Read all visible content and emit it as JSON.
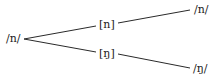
{
  "diagram": {
    "type": "tree",
    "colors": {
      "line": "#2a2a2a",
      "text": "#1a1a1a",
      "background": "#ffffff"
    },
    "nodes": {
      "root": {
        "label": "/n/"
      },
      "upper_mid": {
        "label": "[n]"
      },
      "lower_mid": {
        "label": "[ŋ]"
      },
      "upper_end": {
        "label": "/n/"
      },
      "lower_end": {
        "label": "/ŋ/"
      }
    },
    "edges": [
      {
        "from": "root",
        "to": "upper_mid"
      },
      {
        "from": "root",
        "to": "lower_mid"
      },
      {
        "from": "upper_mid",
        "to": "upper_end"
      },
      {
        "from": "lower_mid",
        "to": "lower_end"
      }
    ]
  }
}
